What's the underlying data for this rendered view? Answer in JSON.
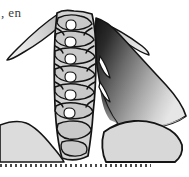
{
  "page": {
    "width": 189,
    "height": 177,
    "background_color": "#ffffff",
    "kind": "scanned-book-figure-fragment"
  },
  "caption": {
    "text_fragment": ", en",
    "color": "#3a3a3a",
    "position": "top-left"
  },
  "figure": {
    "palette": {
      "outline": "#111111",
      "bone_light": "#d9d9d9",
      "bone_mid": "#c4c4c4",
      "mass_gray": "#d6d6d6",
      "shadow_dark": "#1a1a1a",
      "shadow_mid": "#6e6e6e",
      "highlight": "#f2f2f2",
      "paper": "#ffffff"
    },
    "parts": [
      {
        "id": "vertebral-column",
        "label": "vertebral column",
        "fill": "#d3d3d3"
      },
      {
        "id": "left-wing-process",
        "label": "left wing-like process",
        "fill": "#d5d5d5"
      },
      {
        "id": "right-wing-process",
        "label": "right wing-like process",
        "fill": "#d5d5d5"
      },
      {
        "id": "shaded-muscle-mass",
        "label": "shaded muscle mass",
        "fill": "gradient-dark-to-light"
      },
      {
        "id": "lower-left-mass",
        "label": "lower left tissue mass",
        "fill": "#dcdcdc"
      },
      {
        "id": "lower-right-mass",
        "label": "lower right tissue mass",
        "fill": "#d8d8d8"
      },
      {
        "id": "intercostal-opening-upper",
        "label": "upper elongated opening",
        "fill": "#ffffff"
      },
      {
        "id": "intercostal-opening-lower",
        "label": "lower elongated opening",
        "fill": "#ffffff"
      }
    ],
    "vertebra_count": 6
  },
  "rule": {
    "style": "dotted",
    "color": "#4a4a4a",
    "length_px": 151,
    "dot_pitch_px": 5
  }
}
